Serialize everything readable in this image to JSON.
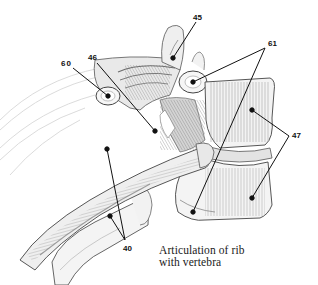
{
  "figure": {
    "caption_line1": "Articulation of rib",
    "caption_line2": "with vertebra",
    "labels": [
      {
        "id": "45",
        "text": "45",
        "x": 193,
        "y": 16
      },
      {
        "id": "61",
        "text": "61",
        "x": 268,
        "y": 40
      },
      {
        "id": "60",
        "text": "60",
        "x": 61,
        "y": 60
      },
      {
        "id": "46",
        "text": "46",
        "x": 89,
        "y": 55
      },
      {
        "id": "47",
        "text": "47",
        "x": 292,
        "y": 134
      },
      {
        "id": "40",
        "text": "40",
        "x": 124,
        "y": 245
      }
    ],
    "colors": {
      "ink": "#111111",
      "shade": "#8a8a8a",
      "light": "#cfcfcf",
      "paper": "#ffffff"
    }
  }
}
